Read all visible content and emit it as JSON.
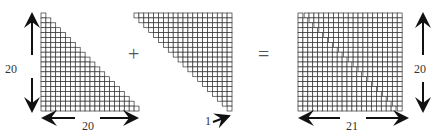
{
  "diagram": {
    "left_triangle": {
      "rows": 20,
      "cols": 20,
      "height_label": "20",
      "width_label": "20"
    },
    "operator_plus": "+",
    "middle_triangle": {
      "rows": 20,
      "cols": 20,
      "offset_label": "1"
    },
    "operator_equals": "=",
    "right_rectangle": {
      "rows": 20,
      "cols": 21,
      "height_label": "20",
      "width_label": "21"
    },
    "colors": {
      "grid": "#333333",
      "background": "#ffffff"
    }
  }
}
